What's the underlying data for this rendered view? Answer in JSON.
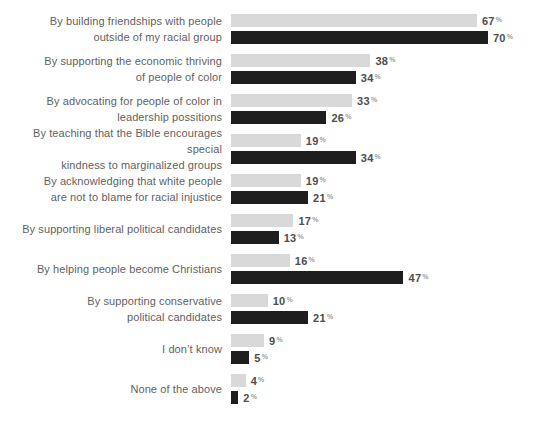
{
  "chart_data": {
    "type": "bar",
    "orientation": "horizontal",
    "title": "",
    "value_suffix": "%",
    "grid": false,
    "legend": "none",
    "xlim": [
      0,
      100
    ],
    "category_label_color": "#5f5f5f",
    "value_label_color": "#4d4d4d",
    "percent_sign_color": "#9b9b9b",
    "categories": [
      {
        "lines": [
          "By building friendships with people",
          "outside of my racial group"
        ]
      },
      {
        "lines": [
          "By supporting the economic thriving",
          "of people of color"
        ]
      },
      {
        "lines": [
          "By advocating for people of color in",
          "leadership possitions"
        ]
      },
      {
        "lines": [
          "By teaching that the Bible encourages special",
          "kindness to marginalized groups"
        ]
      },
      {
        "lines": [
          "By acknowledging that white people",
          "are not to blame for racial injustice"
        ]
      },
      {
        "lines": [
          "By supporting liberal political candidates"
        ]
      },
      {
        "lines": [
          "By helping people become Christians"
        ]
      },
      {
        "lines": [
          "By supporting conservative",
          "political candidates"
        ]
      },
      {
        "lines": [
          "I don’t know"
        ]
      },
      {
        "lines": [
          "None of the above"
        ]
      }
    ],
    "series": [
      {
        "name": "light-gray",
        "color": "#d9d9d9",
        "values": [
          67,
          38,
          33,
          19,
          19,
          17,
          16,
          10,
          9,
          4
        ]
      },
      {
        "name": "dark",
        "color": "#1e1e1e",
        "values": [
          70,
          34,
          26,
          34,
          21,
          13,
          47,
          21,
          5,
          2
        ]
      }
    ]
  }
}
